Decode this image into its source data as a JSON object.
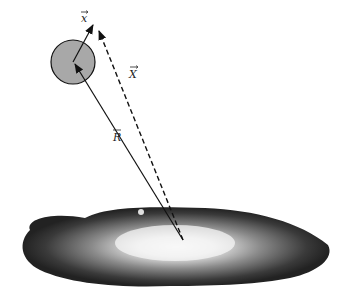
{
  "diagram": {
    "labels": {
      "small_x": "x",
      "big_x": "X",
      "r": "R"
    },
    "colors": {
      "satellite_fill": "#a8a8a8",
      "stroke": "#111111",
      "galaxy_dark": "#2a2a2a",
      "galaxy_core": "#f4f4f4"
    },
    "elements": [
      {
        "id": "satellite",
        "type": "circle",
        "cx": 73,
        "cy": 62,
        "r": 22
      },
      {
        "id": "vector-x",
        "type": "arrow",
        "from": [
          73,
          62
        ],
        "to": [
          93,
          25
        ],
        "style": "solid",
        "label": "x"
      },
      {
        "id": "vector-R",
        "type": "arrow",
        "from": [
          183,
          240
        ],
        "to": [
          73,
          62
        ],
        "style": "solid",
        "label": "R"
      },
      {
        "id": "vector-X",
        "type": "arrow",
        "from": [
          183,
          240
        ],
        "to": [
          99,
          30
        ],
        "style": "dashed",
        "label": "X"
      },
      {
        "id": "galaxy",
        "type": "image-shape",
        "description": "edge-on spiral galaxy"
      }
    ]
  }
}
